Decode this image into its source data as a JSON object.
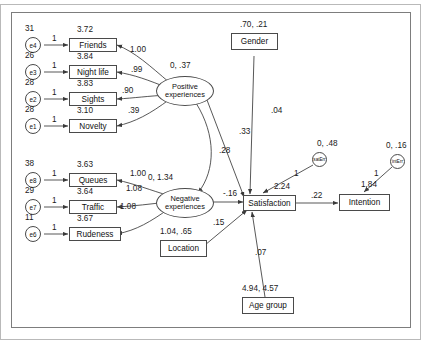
{
  "diagram": {
    "type": "structural-equation-model-path-diagram",
    "title": "",
    "indicators": [
      {
        "name": "Friends",
        "mean": "3.72"
      },
      {
        "name": "Night life",
        "mean": "3.84"
      },
      {
        "name": "Sights",
        "mean": "3.83"
      },
      {
        "name": "Novelty",
        "mean": "3.10"
      },
      {
        "name": "Queues",
        "mean": "3.63"
      },
      {
        "name": "Traffic",
        "mean": "3.64"
      },
      {
        "name": "Rudeness",
        "mean": "3.67"
      }
    ],
    "errors": [
      {
        "name": "e4",
        "variance": "31"
      },
      {
        "name": "e3",
        "variance": "26"
      },
      {
        "name": "e2",
        "variance": "28"
      },
      {
        "name": "e1",
        "variance": "28"
      },
      {
        "name": "e8",
        "variance": "38"
      },
      {
        "name": "e7",
        "variance": "29"
      },
      {
        "name": "e6",
        "variance": "11"
      },
      {
        "name": "satErr",
        "variance": "0, .48"
      },
      {
        "name": "intErr",
        "variance": "0, .16"
      }
    ],
    "latents": [
      {
        "name": "Positive",
        "name2": "experiences",
        "params": "0, .37"
      },
      {
        "name": "Negative",
        "name2": "experiences",
        "params": "0, 1.34"
      }
    ],
    "observed": [
      {
        "name": "Gender",
        "params": ".70, .21"
      },
      {
        "name": "Location",
        "params": "1.04, .65"
      },
      {
        "name": "Age group",
        "params": "4.94, 4.57"
      },
      {
        "name": "Satisfaction",
        "intercept": "2.24"
      },
      {
        "name": "Intention",
        "intercept": "1.84"
      }
    ],
    "loadings": {
      "pos_friends": "1.00",
      "pos_nightlife": ".99",
      "pos_sights": ".90",
      "pos_novelty": ".39",
      "neg_queues": "1.00",
      "neg_traffic": "1.08",
      "neg_rudeness": "1.08",
      "err_unit": "1"
    },
    "paths": {
      "pos_to_sat": ".33",
      "neg_to_sat": "-.16",
      "gender_to_sat": ".04",
      "location_to_sat": ".15",
      "agegroup_to_sat": ".07",
      "sat_to_intention": ".22",
      "pos_neg_covariance": ".28"
    }
  }
}
